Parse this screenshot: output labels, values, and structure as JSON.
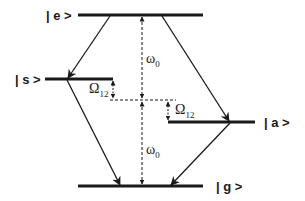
{
  "diagram": {
    "type": "energy-level diagram",
    "levels": [
      {
        "id": "e",
        "label": "| e >"
      },
      {
        "id": "s",
        "label": "| s >"
      },
      {
        "id": "a",
        "label": "| a >"
      },
      {
        "id": "g",
        "label": "| g >"
      }
    ],
    "transitions": [
      {
        "from": "e",
        "to": "s"
      },
      {
        "from": "e",
        "to": "a"
      },
      {
        "from": "s",
        "to": "g"
      },
      {
        "from": "a",
        "to": "g"
      }
    ],
    "annotations": {
      "omega_upper": "ω",
      "omega_upper_sub": "0",
      "omega_lower": "ω",
      "omega_lower_sub": "0",
      "Omega_left": "Ω",
      "Omega_left_sub": "12",
      "Omega_right": "Ω",
      "Omega_right_sub": "12"
    },
    "colors": {
      "ink": "#1a1a1a",
      "background": "#ffffff"
    }
  }
}
